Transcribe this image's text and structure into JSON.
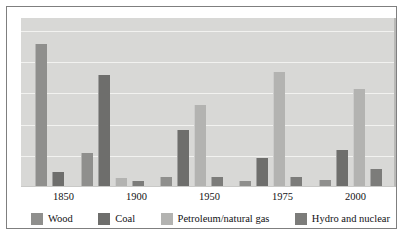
{
  "chart_data": {
    "type": "bar",
    "title": "",
    "subtitle": "",
    "xlabel": "",
    "ylabel": "",
    "ylim": [
      0,
      100
    ],
    "grid": true,
    "gridlines": [
      20,
      40,
      60,
      80,
      100
    ],
    "legend_position": "bottom",
    "value_suffix": "%",
    "categories": [
      "1850",
      "1900",
      "1950",
      "1975",
      "2000"
    ],
    "series": [
      {
        "name": "Wood",
        "color": "#8f8f8d",
        "values": [
          91,
          21,
          6,
          3,
          4
        ],
        "labels": [
          "91%",
          "21%",
          "6%",
          "3%",
          "4%"
        ]
      },
      {
        "name": "Coal",
        "color": "#6e6e6c",
        "values": [
          9,
          71,
          36,
          18,
          23
        ],
        "labels": [
          "9%",
          "71%",
          "36%",
          "18%",
          "23%"
        ]
      },
      {
        "name": "Petroleum/natural gas",
        "color": "#b3b3b1",
        "values": [
          null,
          5,
          52,
          73,
          62
        ],
        "labels": [
          "",
          "5%",
          "52%",
          "73%",
          "62%"
        ]
      },
      {
        "name": "Hydro and nuclear",
        "color": "#7c7c7a",
        "values": [
          null,
          3,
          6,
          6,
          11
        ],
        "labels": [
          "",
          "3%",
          "6%",
          "6%",
          "11%"
        ]
      }
    ]
  },
  "legend": {
    "items": [
      {
        "label": "Wood",
        "color": "#8f8f8d"
      },
      {
        "label": "Coal",
        "color": "#6e6e6c"
      },
      {
        "label": "Petroleum/natural gas",
        "color": "#b3b3b1"
      },
      {
        "label": "Hydro and nuclear",
        "color": "#7c7c7a"
      }
    ]
  },
  "axis": {
    "x_ticks": [
      "1850",
      "1900",
      "1950",
      "1975",
      "2000"
    ]
  },
  "style": {
    "plot_background": "#d8d8d6",
    "gridline_color": "#f2f2f0",
    "frame_color": "#7f7f7f",
    "text_color": "#111114"
  }
}
